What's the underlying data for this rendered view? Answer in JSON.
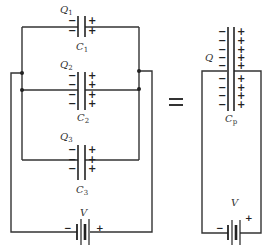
{
  "diagram": {
    "equals_sign": "=",
    "colors": {
      "wire": "#333333",
      "background": "#ffffff"
    },
    "left_circuit": {
      "capacitors": [
        {
          "charge_label": "Q",
          "charge_sub": "1",
          "cap_label": "C",
          "cap_sub": "1",
          "minus": [
            "−",
            "−"
          ],
          "plus": [
            "+",
            "+"
          ]
        },
        {
          "charge_label": "Q",
          "charge_sub": "2",
          "cap_label": "C",
          "cap_sub": "2",
          "minus": [
            "−",
            "−",
            "−",
            "−"
          ],
          "plus": [
            "+",
            "+",
            "+",
            "+"
          ]
        },
        {
          "charge_label": "Q",
          "charge_sub": "3",
          "cap_label": "C",
          "cap_sub": "3",
          "minus": [
            "−",
            "−",
            "−"
          ],
          "plus": [
            "+",
            "+",
            "+"
          ]
        }
      ],
      "battery": {
        "label": "V",
        "minus": "−",
        "plus": "+"
      }
    },
    "right_circuit": {
      "capacitor": {
        "charge_label": "Q",
        "cap_label": "C",
        "cap_sub": "p",
        "minus_count": 9,
        "plus_count": 9,
        "minus": "−",
        "plus": "+"
      },
      "battery": {
        "label": "V",
        "minus": "−",
        "plus": "+"
      }
    }
  }
}
